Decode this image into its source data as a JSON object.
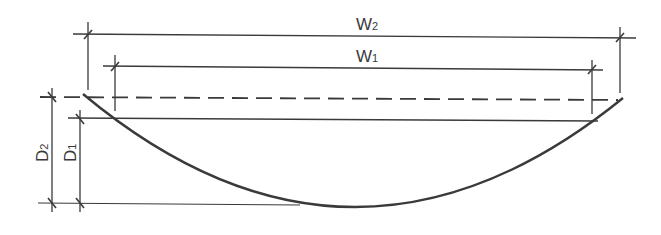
{
  "diagram": {
    "labels": {
      "w2": {
        "main": "W",
        "sub": "2"
      },
      "w1": {
        "main": "W",
        "sub": "1"
      },
      "d2": {
        "main": "D",
        "sub": "2"
      },
      "d1": {
        "main": "D",
        "sub": "1"
      }
    },
    "colors": {
      "line": "#3a3a3a",
      "background": "#ffffff"
    }
  }
}
